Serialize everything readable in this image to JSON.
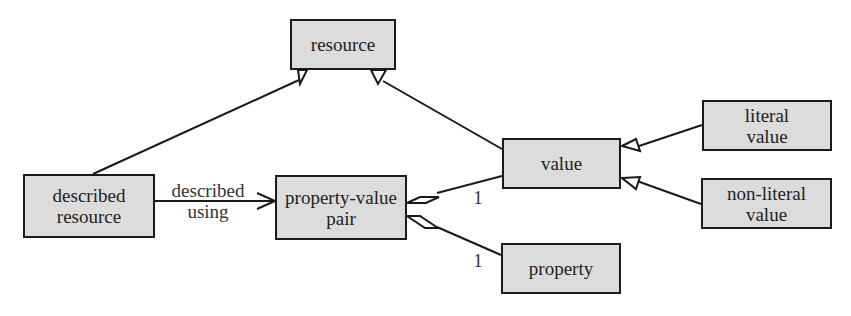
{
  "diagram": {
    "type": "UML class diagram",
    "colors": {
      "box_fill": "#dcdcdc",
      "box_border": "#1a1a1a",
      "line": "#1a1a1a",
      "background": "#ffffff"
    },
    "nodes": {
      "resource": {
        "lines": [
          "resource"
        ]
      },
      "described_resource": {
        "lines": [
          "described",
          "resource"
        ]
      },
      "property_value_pair": {
        "lines": [
          "property-value",
          "pair"
        ]
      },
      "value": {
        "lines": [
          "value"
        ]
      },
      "literal_value": {
        "lines": [
          "literal",
          "value"
        ]
      },
      "non_literal_value": {
        "lines": [
          "non-literal",
          "value"
        ]
      },
      "property": {
        "lines": [
          "property"
        ]
      }
    },
    "edges": [
      {
        "from": "described resource",
        "to": "resource",
        "kind": "generalization"
      },
      {
        "from": "value",
        "to": "resource",
        "kind": "generalization"
      },
      {
        "from": "described resource",
        "to": "property-value pair",
        "kind": "association",
        "label_lines": [
          "described",
          "using"
        ]
      },
      {
        "from": "property-value pair",
        "to": "value",
        "kind": "aggregation",
        "multiplicity": "1"
      },
      {
        "from": "property-value pair",
        "to": "property",
        "kind": "aggregation",
        "multiplicity": "1"
      },
      {
        "from": "literal value",
        "to": "value",
        "kind": "generalization"
      },
      {
        "from": "non-literal value",
        "to": "value",
        "kind": "generalization"
      }
    ],
    "labels": {
      "described_using": [
        "described",
        "using"
      ],
      "multiplicity_value": "1",
      "multiplicity_property": "1"
    }
  }
}
